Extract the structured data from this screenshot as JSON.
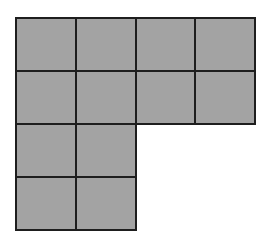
{
  "figure": {
    "fill_color": "#a3a3a3",
    "line_color": "#1e1e1e",
    "origin": {
      "x": 16,
      "y": 18
    },
    "cell_width": 59.75,
    "cell_height": 53,
    "rows": [
      {
        "row": 0,
        "columns": [
          0,
          1,
          2,
          3
        ]
      },
      {
        "row": 1,
        "columns": [
          0,
          1,
          2,
          3
        ]
      },
      {
        "row": 2,
        "columns": [
          0,
          1
        ]
      },
      {
        "row": 3,
        "columns": [
          0,
          1
        ]
      }
    ],
    "total_squares": 12
  }
}
